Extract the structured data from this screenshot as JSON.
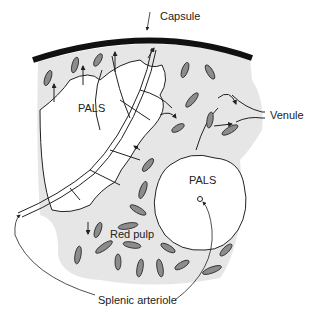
{
  "diagram": {
    "labels": {
      "capsule": "Capsule",
      "pals_upper": "PALS",
      "pals_lower": "PALS",
      "venule": "Venule",
      "red_pulp": "Red pulp",
      "splenic_arteriole": "Splenic arteriole"
    },
    "colors": {
      "red_pulp_fill": "#e6e6e6",
      "cell_fill": "#8c8c8c",
      "outline": "#222222",
      "capsule": "#111111",
      "background": "#ffffff"
    }
  }
}
